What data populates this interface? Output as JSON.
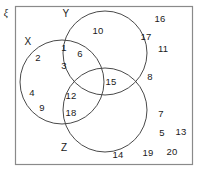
{
  "diagram": {
    "type": "venn-3-set",
    "universe_symbol": "ξ",
    "universe_rect": {
      "x": 15,
      "y": 6,
      "width": 178,
      "height": 159
    },
    "background_color": "#ffffff",
    "stroke_color": "#3a3a3a",
    "text_color": "#1a1a1a",
    "sets": [
      {
        "name": "X",
        "label": "X",
        "label_x": 28,
        "label_y": 42,
        "cx": 62,
        "cy": 82,
        "r": 42
      },
      {
        "name": "Y",
        "label": "Y",
        "label_x": 66,
        "label_y": 14,
        "cx": 105,
        "cy": 53,
        "r": 42
      },
      {
        "name": "Z",
        "label": "Z",
        "label_x": 64,
        "label_y": 148,
        "cx": 105,
        "cy": 110,
        "r": 42
      }
    ],
    "regions": [
      {
        "region": "X-only",
        "elements": [
          {
            "value": "2",
            "x": 38,
            "y": 58
          },
          {
            "value": "4",
            "x": 32,
            "y": 93
          },
          {
            "value": "9",
            "x": 42,
            "y": 108
          }
        ]
      },
      {
        "region": "Y-only",
        "elements": [
          {
            "value": "10",
            "x": 98,
            "y": 31
          }
        ]
      },
      {
        "region": "Z-only",
        "elements": [
          {
            "value": "14",
            "x": 118,
            "y": 155
          }
        ]
      },
      {
        "region": "X-and-Y",
        "elements": [
          {
            "value": "1",
            "x": 64,
            "y": 48
          },
          {
            "value": "6",
            "x": 80,
            "y": 54
          },
          {
            "value": "3",
            "x": 64,
            "y": 66
          }
        ]
      },
      {
        "region": "Y-and-Z",
        "elements": [
          {
            "value": "15",
            "x": 111,
            "y": 82
          }
        ]
      },
      {
        "region": "X-and-Z",
        "elements": [
          {
            "value": "12",
            "x": 71,
            "y": 96
          },
          {
            "value": "18",
            "x": 71,
            "y": 113
          }
        ]
      },
      {
        "region": "X-and-Y-and-Z",
        "elements": []
      },
      {
        "region": "outside-all-sets",
        "elements": [
          {
            "value": "16",
            "x": 160,
            "y": 19
          },
          {
            "value": "17",
            "x": 146,
            "y": 37
          },
          {
            "value": "11",
            "x": 163,
            "y": 49
          },
          {
            "value": "8",
            "x": 150,
            "y": 77
          },
          {
            "value": "7",
            "x": 161,
            "y": 114
          },
          {
            "value": "5",
            "x": 162,
            "y": 133
          },
          {
            "value": "13",
            "x": 181,
            "y": 132
          },
          {
            "value": "19",
            "x": 148,
            "y": 153
          },
          {
            "value": "20",
            "x": 172,
            "y": 152
          }
        ]
      }
    ]
  }
}
